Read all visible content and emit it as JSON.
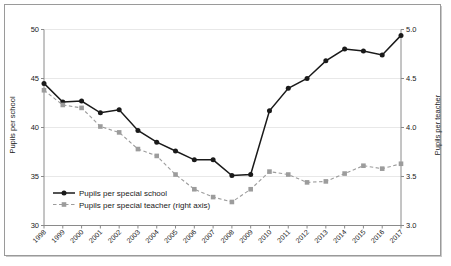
{
  "chart_data": {
    "type": "line",
    "title": "",
    "xlabel": "",
    "ylabel": "Pupils per school",
    "y2label": "Pupils per teacher",
    "grid": true,
    "legend_position": "inside-lower-left",
    "ylim": [
      30,
      50
    ],
    "y2lim": [
      3.0,
      5.0
    ],
    "yticks": [
      "30",
      "35",
      "40",
      "45",
      "50"
    ],
    "y2ticks": [
      "3.0",
      "3.5",
      "4.0",
      "4.5",
      "5.0"
    ],
    "categories": [
      "1998",
      "1999",
      "2000",
      "2001",
      "2002",
      "2003",
      "2004",
      "2005",
      "2006",
      "2007",
      "2008",
      "2009",
      "2010",
      "2011",
      "2012",
      "2013",
      "2014",
      "2015",
      "2016",
      "2017"
    ],
    "series": [
      {
        "name": "Pupils per special school",
        "axis": "left",
        "style": "solid",
        "marker": "circle",
        "color": "#1a1a1a",
        "values": [
          44.5,
          42.6,
          42.7,
          41.5,
          41.8,
          39.7,
          38.5,
          37.6,
          36.7,
          36.7,
          35.1,
          35.2,
          41.7,
          44.0,
          45.0,
          46.8,
          48.0,
          47.8,
          47.4,
          49.4
        ]
      },
      {
        "name": "Pupils per special teacher (right axis)",
        "axis": "right",
        "style": "dashed",
        "marker": "square",
        "color": "#9c9c9c",
        "values": [
          4.38,
          4.23,
          4.2,
          4.01,
          3.95,
          3.78,
          3.71,
          3.52,
          3.37,
          3.29,
          3.24,
          3.37,
          3.55,
          3.52,
          3.44,
          3.45,
          3.53,
          3.61,
          3.58,
          3.63
        ]
      }
    ]
  },
  "legend": {
    "items": [
      {
        "label": "Pupils per special school"
      },
      {
        "label": "Pupils per special teacher (right axis)"
      }
    ]
  }
}
